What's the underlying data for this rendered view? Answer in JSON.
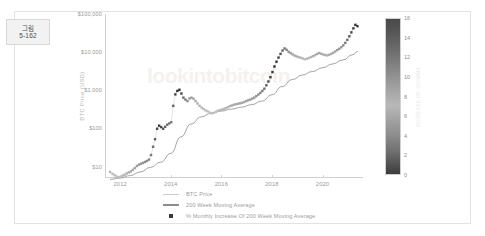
{
  "figure_tag": {
    "line1": "그림",
    "line2": "5-162"
  },
  "chart_data": {
    "type": "scatter",
    "title": "",
    "xlabel": "",
    "ylabel": "BTC Price (USD)",
    "yscale": "log",
    "ylim": [
      5,
      100000
    ],
    "xlim": [
      2011.4,
      2021.6
    ],
    "grid": false,
    "legend_position": "bottom-center",
    "ytick_labels": [
      "$100,000",
      "$10,000",
      "$1,000",
      "$100",
      "$10"
    ],
    "ytick_values": [
      100000,
      10000,
      1000,
      100,
      10
    ],
    "xtick_labels": [
      "2012",
      "2014",
      "2016",
      "2018",
      "2020"
    ],
    "xtick_values": [
      2012,
      2014,
      2016,
      2018,
      2020
    ],
    "watermark": "lookintobitcoin",
    "colorbar": {
      "label": "INCREASE OF 200WMA",
      "ticks": [
        0,
        2,
        4,
        6,
        8,
        10,
        12,
        14,
        16
      ],
      "min": 0,
      "max": 16,
      "colormap": "grayscale"
    },
    "legend": [
      {
        "label": "BTC Price",
        "marker": "line-thin",
        "color": "#cfcfcf"
      },
      {
        "label": "200 Week Moving Average",
        "marker": "line-thick",
        "color": "#8c8c8c"
      },
      {
        "label": "% Monthly Increase Of 200 Week Moving Average",
        "marker": "square",
        "color": "#3a3a3a"
      }
    ],
    "series": [
      {
        "name": "BTC Price",
        "type": "scatter",
        "x": [
          2011.6,
          2011.7,
          2011.78,
          2011.86,
          2011.94,
          2012.02,
          2012.1,
          2012.18,
          2012.26,
          2012.34,
          2012.42,
          2012.5,
          2012.58,
          2012.66,
          2012.74,
          2012.82,
          2012.9,
          2012.98,
          2013.06,
          2013.14,
          2013.22,
          2013.3,
          2013.38,
          2013.46,
          2013.54,
          2013.62,
          2013.7,
          2013.78,
          2013.86,
          2013.94,
          2014.02,
          2014.1,
          2014.18,
          2014.26,
          2014.34,
          2014.42,
          2014.5,
          2014.58,
          2014.66,
          2014.74,
          2014.82,
          2014.9,
          2014.98,
          2015.06,
          2015.14,
          2015.22,
          2015.3,
          2015.38,
          2015.46,
          2015.54,
          2015.62,
          2015.7,
          2015.78,
          2015.86,
          2015.94,
          2016.02,
          2016.1,
          2016.18,
          2016.26,
          2016.34,
          2016.42,
          2016.5,
          2016.58,
          2016.66,
          2016.74,
          2016.82,
          2016.9,
          2016.98,
          2017.06,
          2017.14,
          2017.22,
          2017.3,
          2017.38,
          2017.46,
          2017.54,
          2017.62,
          2017.7,
          2017.78,
          2017.86,
          2017.94,
          2018.02,
          2018.1,
          2018.18,
          2018.26,
          2018.34,
          2018.42,
          2018.5,
          2018.58,
          2018.66,
          2018.74,
          2018.82,
          2018.9,
          2018.98,
          2019.06,
          2019.14,
          2019.22,
          2019.3,
          2019.38,
          2019.46,
          2019.54,
          2019.62,
          2019.7,
          2019.78,
          2019.86,
          2019.94,
          2020.02,
          2020.1,
          2020.18,
          2020.26,
          2020.34,
          2020.42,
          2020.5,
          2020.58,
          2020.66,
          2020.74,
          2020.82,
          2020.9,
          2020.98,
          2021.06,
          2021.14,
          2021.22,
          2021.3,
          2021.38
        ],
        "y": [
          7.2,
          6.4,
          5.9,
          5.5,
          5.2,
          5.4,
          5.8,
          6.1,
          6.6,
          7.0,
          7.4,
          8.2,
          9.1,
          10.3,
          11.2,
          11.8,
          12.4,
          13.2,
          14.0,
          15.2,
          20.0,
          33.0,
          52.0,
          98.0,
          118.0,
          108.0,
          98.0,
          110.0,
          125.0,
          135.0,
          145.0,
          390.0,
          780.0,
          960.0,
          1030.0,
          820.0,
          640.0,
          570.0,
          520.0,
          610.0,
          640.0,
          600.0,
          520.0,
          450.0,
          390.0,
          350.0,
          320.0,
          295.0,
          280.0,
          260.0,
          248.0,
          255.0,
          270.0,
          290.0,
          300.0,
          310.0,
          325.0,
          340.0,
          360.0,
          385.0,
          400.0,
          418.0,
          430.0,
          442.0,
          455.0,
          470.0,
          490.0,
          520.0,
          545.0,
          570.0,
          600.0,
          640.0,
          700.0,
          770.0,
          850.0,
          960.0,
          1100.0,
          1350.0,
          1700.0,
          2200.0,
          3000.0,
          4200.0,
          5600.0,
          7200.0,
          9000.0,
          11000.0,
          12500.0,
          11500.0,
          10200.0,
          9400.0,
          8700.0,
          8100.0,
          7700.0,
          7400.0,
          7100.0,
          6800.0,
          6500.0,
          6700.0,
          7000.0,
          7400.0,
          7800.0,
          8300.0,
          8900.0,
          9500.0,
          9100.0,
          8700.0,
          8400.0,
          8200.0,
          8500.0,
          9000.0,
          9600.0,
          10400.0,
          11300.0,
          12200.0,
          13400.0,
          15000.0,
          17500.0,
          21000.0,
          26000.0,
          33000.0,
          42000.0,
          52000.0,
          48000.0
        ],
        "color_values": [
          2.1,
          2.0,
          1.9,
          1.8,
          1.7,
          1.9,
          2.1,
          2.3,
          2.6,
          3.0,
          3.4,
          3.9,
          4.3,
          4.8,
          5.2,
          5.5,
          5.8,
          6.2,
          6.6,
          7.2,
          8.4,
          9.8,
          11.2,
          13.4,
          14.6,
          13.2,
          11.8,
          10.4,
          9.6,
          9.0,
          8.4,
          10.8,
          13.6,
          15.2,
          15.8,
          13.0,
          10.0,
          8.0,
          6.4,
          5.6,
          4.8,
          4.0,
          3.4,
          2.9,
          2.5,
          2.2,
          1.9,
          1.7,
          1.5,
          1.3,
          1.2,
          1.3,
          1.5,
          1.7,
          1.9,
          2.1,
          2.3,
          2.5,
          2.7,
          3.0,
          3.2,
          3.4,
          3.5,
          3.6,
          3.7,
          3.8,
          4.0,
          4.2,
          4.4,
          4.6,
          4.9,
          5.3,
          5.8,
          6.4,
          7.2,
          8.2,
          9.4,
          11.0,
          12.8,
          14.2,
          15.2,
          15.8,
          15.4,
          14.0,
          12.2,
          10.4,
          8.8,
          7.2,
          6.0,
          5.0,
          4.2,
          3.6,
          3.1,
          2.7,
          2.4,
          2.1,
          1.9,
          2.0,
          2.2,
          2.5,
          2.8,
          3.1,
          3.4,
          3.7,
          3.5,
          3.2,
          3.0,
          2.9,
          3.1,
          3.4,
          3.8,
          4.2,
          4.7,
          5.2,
          5.9,
          6.8,
          8.0,
          9.6,
          11.4,
          13.0,
          14.4,
          15.4,
          14.8
        ]
      },
      {
        "name": "200 Week Moving Average",
        "type": "line",
        "color": "#8c8c8c",
        "x": [
          2011.6,
          2012.0,
          2012.4,
          2012.8,
          2013.2,
          2013.6,
          2014.0,
          2014.4,
          2014.8,
          2015.2,
          2015.6,
          2016.0,
          2016.4,
          2016.8,
          2017.2,
          2017.6,
          2018.0,
          2018.4,
          2018.8,
          2019.2,
          2019.6,
          2020.0,
          2020.4,
          2020.8,
          2021.2,
          2021.4
        ],
        "y": [
          4.6,
          5.0,
          5.8,
          7.2,
          9.5,
          13.0,
          22.0,
          60.0,
          130.0,
          200.0,
          250.0,
          285.0,
          320.0,
          360.0,
          420.0,
          520.0,
          760.0,
          1250.0,
          1900.0,
          2500.0,
          3100.0,
          3900.0,
          4900.0,
          6200.0,
          8600.0,
          10500.0
        ]
      }
    ]
  }
}
